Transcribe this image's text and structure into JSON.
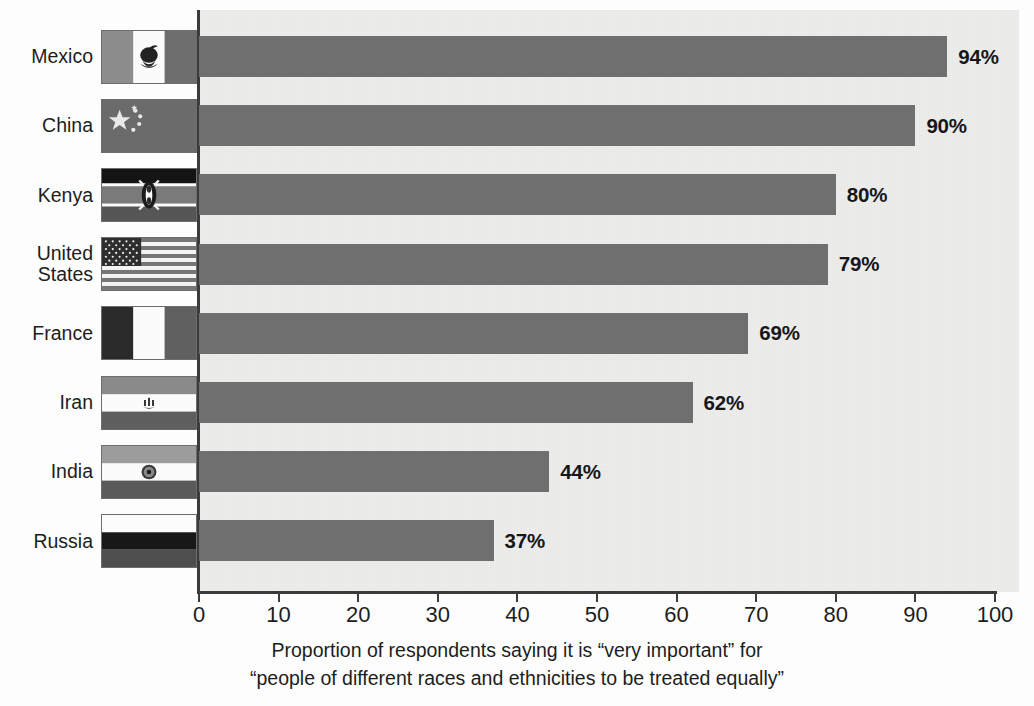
{
  "chart_data": {
    "type": "bar",
    "orientation": "horizontal",
    "title": "",
    "subtitle": "",
    "caption_lines": [
      "Proportion of respondents saying it is “very important” for",
      "“people of different races and ethnicities to be treated equally”"
    ],
    "xlabel": "",
    "ylabel": "",
    "xlim": [
      0,
      100
    ],
    "xticks": [
      0,
      10,
      20,
      30,
      40,
      50,
      60,
      70,
      80,
      90,
      100
    ],
    "xtick_labels": [
      "0",
      "10",
      "20",
      "30",
      "40",
      "50",
      "60",
      "70",
      "80",
      "90",
      "100"
    ],
    "grid": false,
    "legend": null,
    "bar_color": "#6f6f6f",
    "plot_background": "#ededec",
    "categories": [
      "Mexico",
      "China",
      "Kenya",
      "United States",
      "France",
      "Iran",
      "India",
      "Russia"
    ],
    "values": [
      94,
      90,
      80,
      79,
      69,
      62,
      44,
      37
    ],
    "value_labels": [
      "94%",
      "90%",
      "80%",
      "79%",
      "69%",
      "62%",
      "44%",
      "37%"
    ],
    "series": [
      {
        "name": "Proportion saying “very important”",
        "values": [
          94,
          90,
          80,
          79,
          69,
          62,
          44,
          37
        ]
      }
    ]
  },
  "countries": [
    {
      "label": "Mexico",
      "label_lines": "Mexico",
      "value": 94,
      "value_label": "94%",
      "flag": "flag-mexico"
    },
    {
      "label": "China",
      "label_lines": "China",
      "value": 90,
      "value_label": "90%",
      "flag": "flag-china"
    },
    {
      "label": "Kenya",
      "label_lines": "Kenya",
      "value": 80,
      "value_label": "80%",
      "flag": "flag-kenya"
    },
    {
      "label": "United States",
      "label_lines": "United\nStates",
      "value": 79,
      "value_label": "79%",
      "flag": "flag-united-states"
    },
    {
      "label": "France",
      "label_lines": "France",
      "value": 69,
      "value_label": "69%",
      "flag": "flag-france"
    },
    {
      "label": "Iran",
      "label_lines": "Iran",
      "value": 62,
      "value_label": "62%",
      "flag": "flag-iran"
    },
    {
      "label": "India",
      "label_lines": "India",
      "value": 44,
      "value_label": "44%",
      "flag": "flag-india"
    },
    {
      "label": "Russia",
      "label_lines": "Russia",
      "value": 37,
      "value_label": "37%",
      "flag": "flag-russia"
    }
  ],
  "colors": {
    "bar": "#6f6f6f",
    "plot_background": "#ededec",
    "axis": "#3b3b3b",
    "text": "#1d1d20",
    "page_background": "#fdfdfd"
  }
}
